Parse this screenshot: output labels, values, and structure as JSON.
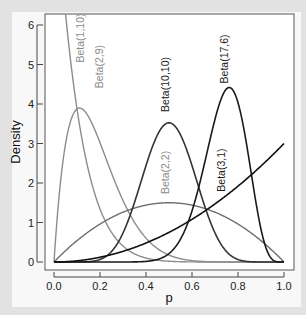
{
  "chart_data": {
    "type": "line",
    "title": "",
    "xlabel": "p",
    "ylabel": "Density",
    "xlim": [
      0,
      1
    ],
    "ylim": [
      0,
      6
    ],
    "xticks": [
      "0.0",
      "0.2",
      "0.4",
      "0.6",
      "0.8",
      "1.0"
    ],
    "yticks": [
      "0",
      "1",
      "2",
      "3",
      "4",
      "5",
      "6"
    ],
    "grid": false,
    "legend": "none (inline rotated labels)",
    "series": [
      {
        "name": "Beta(1,10)",
        "a": 1,
        "b": 10,
        "color": "#8c8c8c",
        "label_pos": [
          0.13,
          5.05
        ],
        "label": "Beta(1,10)"
      },
      {
        "name": "Beta(2,9)",
        "a": 2,
        "b": 9,
        "color": "#8c8c8c",
        "label_pos": [
          0.215,
          4.4
        ],
        "label": "Beta(2,9)"
      },
      {
        "name": "Beta(2,2)",
        "a": 2,
        "b": 2,
        "color": "#6e6e6e",
        "label_pos": [
          0.5,
          1.72
        ],
        "label": "Beta(2,2)"
      },
      {
        "name": "Beta(10,10)",
        "a": 10,
        "b": 10,
        "color": "#333333",
        "label_pos": [
          0.5,
          3.8
        ],
        "label": "Beta(10,10)"
      },
      {
        "name": "Beta(17,6)",
        "a": 17,
        "b": 6,
        "color": "#1a1a1a",
        "label_pos": [
          0.755,
          4.52
        ],
        "label": "Beta(17,6)"
      },
      {
        "name": "Beta(3,1)",
        "a": 3,
        "b": 1,
        "color": "#111111",
        "label_pos": [
          0.745,
          1.78
        ],
        "label": "Beta(3,1)"
      }
    ],
    "peaks": {
      "Beta(1,10)": "10 at p=0 (clipped at 6)",
      "Beta(2,9)": "3.87 at p=0.11",
      "Beta(2,2)": "1.5 at p=0.5",
      "Beta(10,10)": "3.52 at p=0.5",
      "Beta(17,6)": "4.4 at p=0.76",
      "Beta(3,1)": "3 at p=1"
    }
  }
}
